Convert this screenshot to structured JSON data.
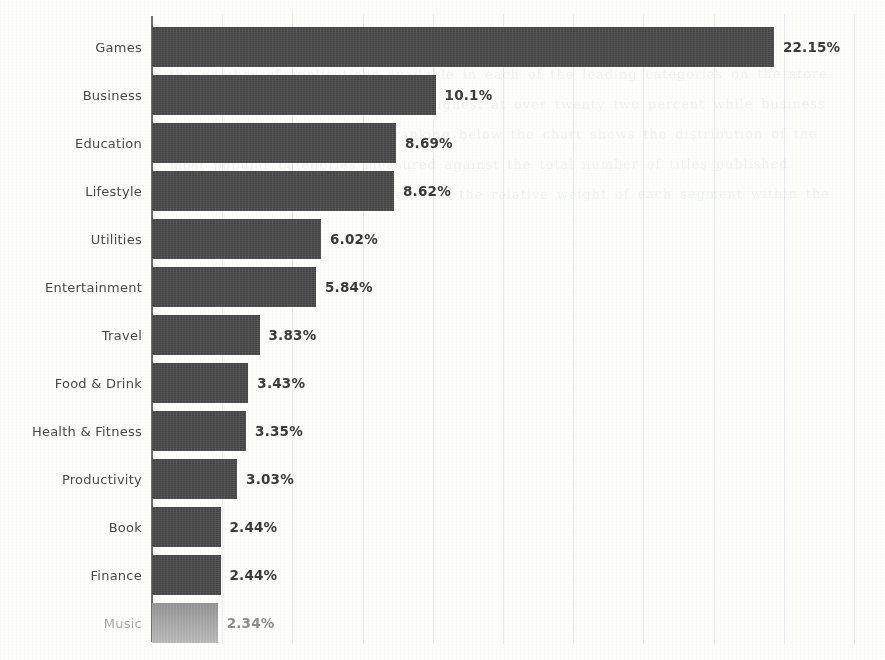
{
  "chart_data": {
    "type": "bar",
    "orientation": "horizontal",
    "title": "",
    "subtitle": "",
    "xlabel": "",
    "ylabel": "",
    "categories": [
      "Games",
      "Business",
      "Education",
      "Lifestyle",
      "Utilities",
      "Entertainment",
      "Travel",
      "Food & Drink",
      "Health & Fitness",
      "Productivity",
      "Book",
      "Finance",
      "Music"
    ],
    "values": [
      22.15,
      10.1,
      8.69,
      8.62,
      6.02,
      5.84,
      3.83,
      3.43,
      3.35,
      3.03,
      2.44,
      2.44,
      2.34
    ],
    "value_labels": [
      "22.15%",
      "10.1%",
      "8.69%",
      "8.62%",
      "6.02%",
      "5.84%",
      "3.83%",
      "3.43%",
      "3.35%",
      "3.03%",
      "2.44%",
      "2.44%",
      "2.34%"
    ],
    "xlim": [
      0,
      25.5
    ],
    "gridlines_x": [
      2.5,
      5,
      7.5,
      10,
      12.5,
      15,
      17.5,
      20,
      22.5,
      25
    ],
    "grid": true,
    "legend": "none",
    "bar_color": "#4b4b4b",
    "faded_bar_color": "#b9b9b9",
    "value_label_color": "#3b3b3b",
    "category_label_color": "#4a4a4a",
    "axis_color": "#4f4f4f",
    "background_color": "#fdfdfc",
    "faded_rows": [
      "Music"
    ]
  },
  "page": {
    "bleed_through_text": "the number of applications available in each of the leading categories on the store the share of games remains the highest at over twenty two percent while business and education follow in the ranking below the chart shows the distribution of the most popular categories measured against the total number of titles published during the period under review and the relative weight of each segment within the overall catalogue"
  }
}
